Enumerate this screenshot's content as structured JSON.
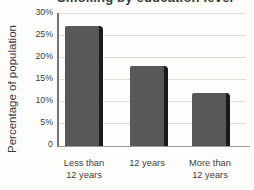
{
  "chart_data": {
    "type": "bar",
    "title": "Smoking by education level",
    "title_display": "cropped by top edge of image (only descenders visible)",
    "ylabel": "Percentage of population",
    "categories": [
      "Less than 12 years",
      "12 years",
      "More than 12 years"
    ],
    "category_lines": [
      [
        "Less than",
        "12 years"
      ],
      [
        "12 years"
      ],
      [
        "More than",
        "12 years"
      ]
    ],
    "values": [
      27,
      18,
      12
    ],
    "unit": "%",
    "yticks": [
      "30%",
      "25%",
      "20%",
      "15%",
      "10%",
      "5%",
      "0"
    ],
    "ytick_values": [
      30,
      25,
      20,
      15,
      10,
      5,
      0
    ],
    "ylim": [
      0,
      30
    ],
    "grid": true,
    "legend": "none"
  },
  "colors": {
    "bar_fill": "#58585a",
    "bar_shadow": "#1a1a1a",
    "gridline": "#deddd6",
    "axis_line": "#9a9a96",
    "text": "#3e3e3e",
    "background": "#fdfdfb"
  }
}
